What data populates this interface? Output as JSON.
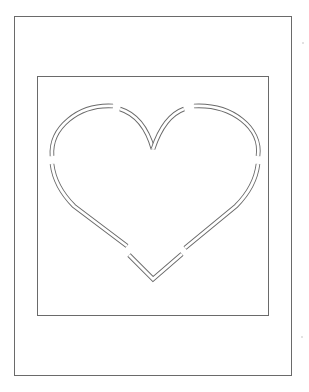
{
  "page": {
    "title": ""
  },
  "colors": {
    "line": "#6a6a6a",
    "background": "#ffffff"
  },
  "frames": {
    "outer": {
      "x": 14,
      "y": 16,
      "w": 278,
      "h": 360
    },
    "inner": {
      "x": 37,
      "y": 76,
      "w": 232,
      "h": 240
    }
  },
  "heart": {
    "segments": [
      {
        "name": "upper-left-outer-arc",
        "d": "M 52 156 C 50 128, 78 104, 113 106"
      },
      {
        "name": "upper-left-inner-arc",
        "d": "M 120 109 C 136 114, 147 128, 153 149"
      },
      {
        "name": "upper-right-inner-arc",
        "d": "M 153 149 C 160 128, 170 114, 184 109"
      },
      {
        "name": "upper-right-outer-arc",
        "d": "M 194 106 C 232 104, 262 128, 258 156"
      },
      {
        "name": "lower-left-side",
        "d": "M 52 164 C 54 180, 62 194, 74 206 L 127 246"
      },
      {
        "name": "lower-right-side",
        "d": "M 258 164 C 256 180, 248 194, 236 206 L 185 248"
      },
      {
        "name": "bottom-point",
        "d": "M 129 255 L 153 279 L 182 254"
      }
    ]
  }
}
